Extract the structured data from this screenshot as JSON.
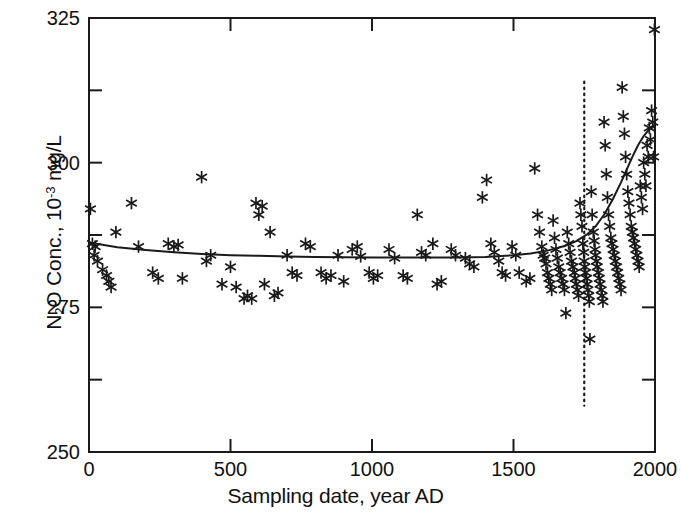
{
  "chart_data": {
    "type": "scatter",
    "title": "",
    "xlabel": "Sampling date, year AD",
    "ylabel": "N2O Conc., 10-3 mg/L",
    "ylabel_parts": {
      "prefix": "N",
      "sub1": "2",
      "mid": "O Conc., 10",
      "sup": "-3",
      "suffix": " mg/L"
    },
    "xlim": [
      0,
      2000
    ],
    "ylim": [
      250,
      325
    ],
    "xticks": [
      0,
      500,
      1000,
      1500,
      2000
    ],
    "xtick_labels": [
      "0",
      "500",
      "1000",
      "1500",
      "2000"
    ],
    "yticks": [
      250,
      275,
      300,
      325
    ],
    "ytick_labels": [
      "250",
      "275",
      "300",
      "325"
    ],
    "yticks_minor": [
      262.5,
      287.5,
      312.5
    ],
    "grid": false,
    "legend": "none",
    "marker": "asterisk",
    "marker_color": "#1a1a1a",
    "line_color": "#1a1a1a",
    "frame_color": "#1a1a1a",
    "annotations": [
      {
        "name": "industrial-era-marker",
        "type": "vline",
        "x": 1750,
        "style": "dotted",
        "y_from": 258,
        "y_to": 314
      }
    ],
    "series": [
      {
        "name": "N2O measurements",
        "type": "scatter",
        "points": [
          [
            5,
            292
          ],
          [
            12,
            286
          ],
          [
            18,
            284
          ],
          [
            22,
            285.5
          ],
          [
            30,
            283
          ],
          [
            48,
            281.5
          ],
          [
            62,
            280.5
          ],
          [
            70,
            279.5
          ],
          [
            78,
            278.5
          ],
          [
            95,
            288
          ],
          [
            150,
            293
          ],
          [
            175,
            285.5
          ],
          [
            225,
            281
          ],
          [
            245,
            280
          ],
          [
            280,
            286
          ],
          [
            300,
            285.5
          ],
          [
            315,
            285.8
          ],
          [
            330,
            280
          ],
          [
            398,
            297.5
          ],
          [
            415,
            283
          ],
          [
            430,
            284
          ],
          [
            470,
            279
          ],
          [
            500,
            282
          ],
          [
            520,
            278.5
          ],
          [
            548,
            276.5
          ],
          [
            560,
            277
          ],
          [
            575,
            276.5
          ],
          [
            590,
            293
          ],
          [
            600,
            291
          ],
          [
            612,
            292.5
          ],
          [
            620,
            279
          ],
          [
            640,
            288
          ],
          [
            655,
            277
          ],
          [
            668,
            277.5
          ],
          [
            700,
            284
          ],
          [
            718,
            281
          ],
          [
            735,
            280.5
          ],
          [
            765,
            286
          ],
          [
            782,
            285.5
          ],
          [
            820,
            281
          ],
          [
            838,
            280
          ],
          [
            855,
            280.5
          ],
          [
            880,
            284
          ],
          [
            900,
            279.5
          ],
          [
            930,
            285
          ],
          [
            948,
            285.5
          ],
          [
            960,
            283.8
          ],
          [
            990,
            281
          ],
          [
            1005,
            280
          ],
          [
            1020,
            280.5
          ],
          [
            1060,
            285
          ],
          [
            1080,
            283.5
          ],
          [
            1110,
            280.5
          ],
          [
            1125,
            280
          ],
          [
            1160,
            291
          ],
          [
            1175,
            284.5
          ],
          [
            1190,
            284
          ],
          [
            1215,
            286
          ],
          [
            1230,
            279
          ],
          [
            1245,
            279.5
          ],
          [
            1280,
            285
          ],
          [
            1295,
            284
          ],
          [
            1330,
            283.5
          ],
          [
            1345,
            282.5
          ],
          [
            1360,
            282
          ],
          [
            1390,
            294
          ],
          [
            1405,
            297
          ],
          [
            1420,
            286
          ],
          [
            1432,
            284.5
          ],
          [
            1448,
            283
          ],
          [
            1460,
            281
          ],
          [
            1472,
            280.5
          ],
          [
            1495,
            285.5
          ],
          [
            1508,
            284
          ],
          [
            1520,
            281
          ],
          [
            1545,
            279.5
          ],
          [
            1558,
            280
          ],
          [
            1575,
            299
          ],
          [
            1585,
            291
          ],
          [
            1592,
            288
          ],
          [
            1600,
            285.5
          ],
          [
            1605,
            284
          ],
          [
            1610,
            283.5
          ],
          [
            1615,
            282.5
          ],
          [
            1620,
            281
          ],
          [
            1625,
            280
          ],
          [
            1630,
            279
          ],
          [
            1635,
            278
          ],
          [
            1640,
            290
          ],
          [
            1645,
            287
          ],
          [
            1650,
            285
          ],
          [
            1655,
            283.5
          ],
          [
            1660,
            282
          ],
          [
            1665,
            281
          ],
          [
            1670,
            280
          ],
          [
            1675,
            279
          ],
          [
            1680,
            278
          ],
          [
            1685,
            274
          ],
          [
            1690,
            288
          ],
          [
            1695,
            286
          ],
          [
            1700,
            284.5
          ],
          [
            1705,
            283
          ],
          [
            1710,
            282
          ],
          [
            1715,
            281
          ],
          [
            1718,
            280
          ],
          [
            1722,
            279
          ],
          [
            1726,
            278
          ],
          [
            1730,
            277
          ],
          [
            1735,
            293
          ],
          [
            1738,
            291
          ],
          [
            1742,
            289
          ],
          [
            1745,
            286
          ],
          [
            1748,
            284.5
          ],
          [
            1750,
            283
          ],
          [
            1752,
            282
          ],
          [
            1755,
            281
          ],
          [
            1758,
            280
          ],
          [
            1760,
            279
          ],
          [
            1763,
            278
          ],
          [
            1766,
            277
          ],
          [
            1768,
            276
          ],
          [
            1770,
            269.5
          ],
          [
            1775,
            295
          ],
          [
            1778,
            291
          ],
          [
            1782,
            288
          ],
          [
            1785,
            286.5
          ],
          [
            1788,
            285
          ],
          [
            1790,
            284
          ],
          [
            1793,
            283
          ],
          [
            1796,
            282
          ],
          [
            1800,
            281
          ],
          [
            1803,
            280
          ],
          [
            1806,
            279
          ],
          [
            1810,
            278
          ],
          [
            1813,
            277
          ],
          [
            1816,
            276
          ],
          [
            1820,
            307
          ],
          [
            1824,
            303
          ],
          [
            1828,
            298
          ],
          [
            1832,
            294
          ],
          [
            1836,
            291
          ],
          [
            1840,
            289
          ],
          [
            1844,
            287
          ],
          [
            1848,
            286
          ],
          [
            1852,
            285
          ],
          [
            1856,
            284
          ],
          [
            1860,
            283
          ],
          [
            1864,
            282
          ],
          [
            1868,
            281
          ],
          [
            1872,
            280
          ],
          [
            1876,
            279
          ],
          [
            1880,
            278
          ],
          [
            1884,
            313
          ],
          [
            1888,
            308
          ],
          [
            1892,
            305
          ],
          [
            1896,
            301
          ],
          [
            1900,
            298
          ],
          [
            1904,
            295
          ],
          [
            1908,
            293
          ],
          [
            1912,
            291
          ],
          [
            1916,
            289
          ],
          [
            1920,
            288
          ],
          [
            1924,
            287
          ],
          [
            1928,
            286
          ],
          [
            1932,
            285
          ],
          [
            1936,
            284
          ],
          [
            1940,
            283
          ],
          [
            1944,
            282
          ],
          [
            1948,
            296
          ],
          [
            1952,
            294
          ],
          [
            1956,
            292
          ],
          [
            1960,
            300
          ],
          [
            1964,
            298
          ],
          [
            1968,
            296
          ],
          [
            1972,
            303
          ],
          [
            1976,
            301
          ],
          [
            1980,
            306
          ],
          [
            1984,
            304
          ],
          [
            1988,
            309
          ],
          [
            1992,
            307
          ],
          [
            1995,
            301
          ],
          [
            1998,
            323
          ]
        ]
      },
      {
        "name": "fitted trend curve",
        "type": "line",
        "points": [
          [
            0,
            286.2
          ],
          [
            100,
            285.4
          ],
          [
            200,
            284.9
          ],
          [
            300,
            284.5
          ],
          [
            400,
            284.2
          ],
          [
            500,
            284.0
          ],
          [
            600,
            283.9
          ],
          [
            700,
            283.8
          ],
          [
            800,
            283.7
          ],
          [
            900,
            283.65
          ],
          [
            1000,
            283.6
          ],
          [
            1100,
            283.6
          ],
          [
            1200,
            283.6
          ],
          [
            1300,
            283.6
          ],
          [
            1400,
            283.7
          ],
          [
            1500,
            284.0
          ],
          [
            1560,
            284.3
          ],
          [
            1620,
            284.8
          ],
          [
            1680,
            285.6
          ],
          [
            1720,
            286.4
          ],
          [
            1760,
            287.6
          ],
          [
            1790,
            289.0
          ],
          [
            1820,
            291.0
          ],
          [
            1850,
            293.6
          ],
          [
            1880,
            296.6
          ],
          [
            1900,
            298.8
          ],
          [
            1920,
            301.0
          ],
          [
            1940,
            303.0
          ],
          [
            1960,
            304.6
          ],
          [
            1980,
            305.8
          ],
          [
            2000,
            306.3
          ]
        ]
      }
    ]
  }
}
